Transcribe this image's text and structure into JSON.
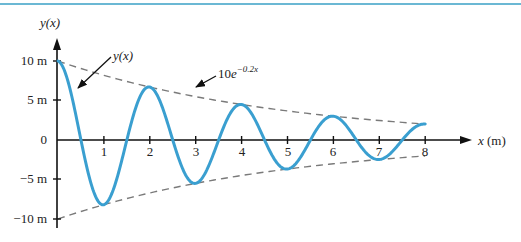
{
  "chart_data": {
    "type": "line",
    "title": "",
    "xlabel": "x (m)",
    "ylabel": "y(x)",
    "x_ticks": [
      "1",
      "2",
      "3",
      "4",
      "5",
      "6",
      "7",
      "8"
    ],
    "y_ticks": [
      "10 m",
      "5 m",
      "0",
      "-5 m",
      "-10 m"
    ],
    "xlim": [
      0,
      8
    ],
    "ylim": [
      -10,
      10
    ],
    "grid": false,
    "series": [
      {
        "name": "y(x)",
        "style": "solid",
        "color": "#3a9fd0",
        "formula": "10 e^{-0.2x} cos(pi x)",
        "x": [
          0,
          1,
          2,
          3,
          4,
          5,
          6,
          7,
          8
        ],
        "values": [
          10,
          -8.19,
          6.7,
          -5.49,
          4.49,
          -3.68,
          3.01,
          -2.47,
          2.02
        ]
      },
      {
        "name": "10e^{-0.2x}",
        "style": "dashed",
        "color": "#888888",
        "x": [
          0,
          2,
          4,
          6,
          8
        ],
        "values": [
          10,
          6.7,
          4.49,
          3.01,
          2.02
        ]
      },
      {
        "name": "-10e^{-0.2x}",
        "style": "dashed",
        "color": "#888888",
        "x": [
          0,
          2,
          4,
          6,
          8
        ],
        "values": [
          -10,
          -6.7,
          -4.49,
          -3.01,
          -2.02
        ]
      }
    ],
    "annotations": [
      "y(x)",
      "10e^{-0.2x}"
    ]
  },
  "labels": {
    "y_axis_title": "y(x)",
    "x_axis_title": "x (m)",
    "curve_annotation": "y(x)",
    "envelope_base": "10e",
    "envelope_exp": "−0.2x",
    "y10": "10 m",
    "y5": "5 m",
    "y0": "0",
    "yn5": "−5 m",
    "yn10": "−10 m",
    "x1": "1",
    "x2": "2",
    "x3": "3",
    "x4": "4",
    "x5": "5",
    "x6": "6",
    "x7": "7",
    "x8": "8"
  }
}
